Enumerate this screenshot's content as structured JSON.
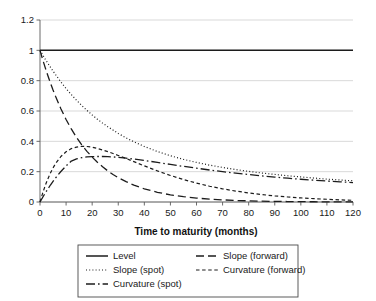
{
  "chart_data": {
    "type": "line",
    "title": "",
    "xlabel": "Time to maturity (months)",
    "ylabel": "",
    "xlim": [
      0,
      120
    ],
    "ylim": [
      0,
      1.2
    ],
    "grid": true,
    "legend_position": "bottom",
    "xticks": [
      0,
      10,
      20,
      30,
      40,
      50,
      60,
      70,
      80,
      90,
      100,
      110,
      120
    ],
    "xtick_labels": [
      "0",
      "10",
      "20",
      "30",
      "40",
      "50",
      "60",
      "70",
      "80",
      "90",
      "100",
      "110",
      "120"
    ],
    "yticks": [
      0,
      0.2,
      0.4,
      0.6,
      0.8,
      1,
      1.2
    ],
    "ytick_labels": [
      "0",
      "0.2",
      "0.4",
      "0.6",
      "0.8",
      "1",
      "1.2"
    ],
    "x": [
      0,
      1,
      2,
      3,
      4,
      5,
      6,
      8,
      10,
      12,
      14,
      16,
      18,
      20,
      22,
      24,
      26,
      28,
      30,
      33,
      36,
      40,
      45,
      50,
      55,
      60,
      65,
      70,
      75,
      80,
      85,
      90,
      95,
      100,
      105,
      110,
      115,
      120
    ],
    "series": [
      {
        "name": "Level",
        "style": "solid",
        "color": "#1c1c1c",
        "values": [
          1,
          1,
          1,
          1,
          1,
          1,
          1,
          1,
          1,
          1,
          1,
          1,
          1,
          1,
          1,
          1,
          1,
          1,
          1,
          1,
          1,
          1,
          1,
          1,
          1,
          1,
          1,
          1,
          1,
          1,
          1,
          1,
          1,
          1,
          1,
          1,
          1,
          1
        ]
      },
      {
        "name": "Slope (spot)",
        "style": "dotted",
        "color": "#1c1c1c",
        "values": [
          1,
          0.971,
          0.942,
          0.915,
          0.889,
          0.863,
          0.839,
          0.792,
          0.748,
          0.708,
          0.671,
          0.636,
          0.604,
          0.574,
          0.546,
          0.52,
          0.496,
          0.474,
          0.452,
          0.423,
          0.397,
          0.366,
          0.333,
          0.305,
          0.281,
          0.261,
          0.243,
          0.228,
          0.214,
          0.202,
          0.191,
          0.182,
          0.173,
          0.165,
          0.158,
          0.151,
          0.145,
          0.14
        ]
      },
      {
        "name": "Curvature (spot)",
        "style": "dashdot",
        "color": "#1c1c1c",
        "values": [
          0,
          0.03,
          0.059,
          0.086,
          0.112,
          0.136,
          0.159,
          0.201,
          0.238,
          0.27,
          0.285,
          0.292,
          0.297,
          0.299,
          0.3,
          0.3,
          0.299,
          0.297,
          0.294,
          0.289,
          0.283,
          0.274,
          0.261,
          0.248,
          0.235,
          0.223,
          0.211,
          0.2,
          0.19,
          0.181,
          0.172,
          0.164,
          0.157,
          0.15,
          0.144,
          0.138,
          0.133,
          0.128
        ]
      },
      {
        "name": "Slope (forward)",
        "style": "longdash",
        "color": "#1c1c1c",
        "values": [
          1,
          0.941,
          0.886,
          0.834,
          0.784,
          0.738,
          0.695,
          0.615,
          0.544,
          0.482,
          0.426,
          0.377,
          0.334,
          0.296,
          0.262,
          0.232,
          0.205,
          0.181,
          0.16,
          0.134,
          0.111,
          0.087,
          0.064,
          0.047,
          0.035,
          0.026,
          0.019,
          0.014,
          0.01,
          0.0075,
          0.0055,
          0.004,
          0.003,
          0.0022,
          0.0016,
          0.0012,
          0.0009,
          0.0007
        ]
      },
      {
        "name": "Curvature (forward)",
        "style": "shortdash",
        "color": "#1c1c1c",
        "values": [
          0,
          0.057,
          0.108,
          0.152,
          0.191,
          0.225,
          0.254,
          0.3,
          0.331,
          0.352,
          0.362,
          0.367,
          0.366,
          0.361,
          0.353,
          0.343,
          0.332,
          0.32,
          0.307,
          0.287,
          0.266,
          0.238,
          0.205,
          0.175,
          0.148,
          0.125,
          0.104,
          0.087,
          0.072,
          0.06,
          0.049,
          0.04,
          0.033,
          0.027,
          0.022,
          0.018,
          0.014,
          0.011
        ]
      }
    ],
    "legend_entries": [
      {
        "label": "Level",
        "style": "solid"
      },
      {
        "label": "Slope (forward)",
        "style": "longdash"
      },
      {
        "label": "Slope (spot)",
        "style": "dotted"
      },
      {
        "label": "Curvature (forward)",
        "style": "shortdash"
      },
      {
        "label": "Curvature (spot)",
        "style": "dashdot"
      }
    ]
  }
}
